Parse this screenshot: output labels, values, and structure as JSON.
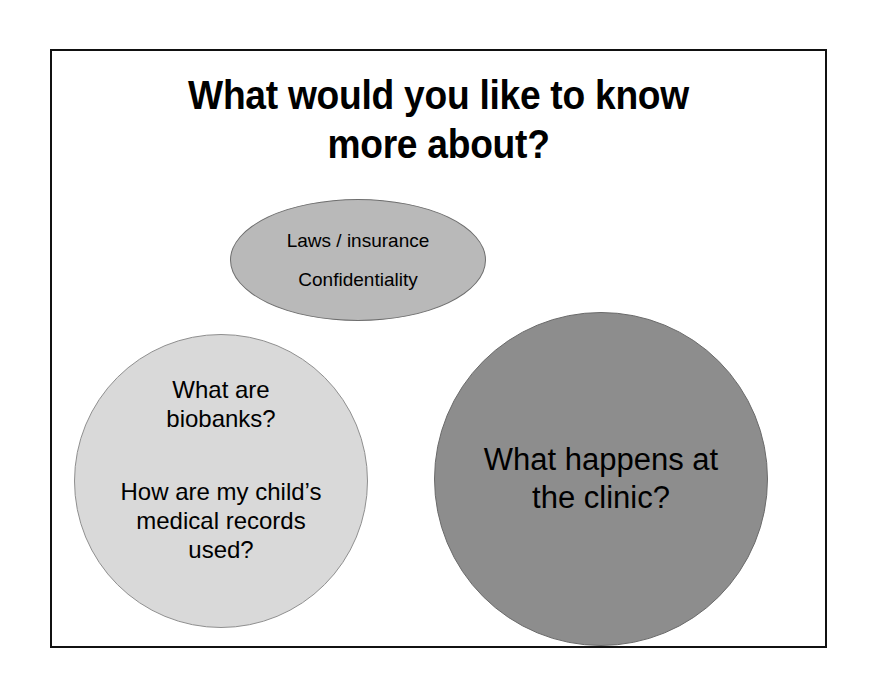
{
  "slide": {
    "title": "What would you like to know\nmore about?",
    "background_color": "#ffffff",
    "border_color": "#111111"
  },
  "bubbles": [
    {
      "name": "laws-insurance",
      "shape": "ellipse",
      "fill_color": "#b9b9b9",
      "lines": [
        "Laws / insurance",
        "Confidentiality"
      ]
    },
    {
      "name": "biobanks",
      "shape": "circle",
      "fill_color": "#d9d9d9",
      "lines": [
        "What are\nbiobanks?",
        "How are my child’s\nmedical records\nused?"
      ]
    },
    {
      "name": "clinic",
      "shape": "circle",
      "fill_color": "#8d8d8d",
      "lines": [
        "What happens at\nthe clinic?"
      ]
    }
  ]
}
